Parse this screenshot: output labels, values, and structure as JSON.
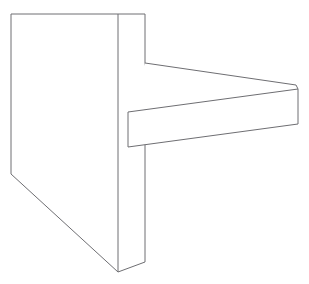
{
  "scene": {
    "title": "3D wireframe line drawing of an L-shaped bracket",
    "object_name": "shelf-bracket",
    "projection": "oblique-parallel",
    "background_color": "#ffffff",
    "line_color": "#6e6e72",
    "fill_color": "#ffffff",
    "line_width": 1,
    "canvas": {
      "width": 309,
      "height": 284
    }
  },
  "geometry": {
    "vertical_slab": {
      "name": "vertical-plate",
      "description": "Trapezoidal upright plate with visible left face and right side thickness",
      "front_face_points": "11,14 118,14 118,272 11,174",
      "side_face_points": "118,14 145,14 145,262 118,272",
      "vertices": {
        "front_top_left": [
          11,
          14
        ],
        "front_top_right": [
          118,
          14
        ],
        "front_bottom_right": [
          118,
          272
        ],
        "front_bottom_left": [
          11,
          174
        ],
        "back_top_right": [
          145,
          14
        ],
        "back_bottom_right": [
          145,
          262
        ]
      }
    },
    "horizontal_beam": {
      "name": "horizontal-arm",
      "description": "Rectangular arm projecting to the right from the plate",
      "top_face_points": "145,63 296,85 298,89 128,112",
      "front_face_points": "128,112 298,89 298,124 128,147",
      "vertices": {
        "top_back_left": [
          145,
          63
        ],
        "top_back_right": [
          296,
          85
        ],
        "top_front_right": [
          298,
          89
        ],
        "top_front_left": [
          128,
          112
        ],
        "bottom_front_right": [
          298,
          124
        ],
        "bottom_front_left": [
          128,
          147
        ]
      }
    }
  },
  "edges": [
    {
      "name": "slab-top-edge",
      "path": "M11,14 L145,14"
    },
    {
      "name": "slab-left-edge",
      "path": "M11,14 L11,174"
    },
    {
      "name": "slab-diagonal-bottom-edge",
      "path": "M11,174 L118,272"
    },
    {
      "name": "slab-front-vertical-edge",
      "path": "M118,14 L118,272"
    },
    {
      "name": "slab-right-vertical-edge",
      "path": "M145,14 L145,262"
    },
    {
      "name": "slab-bottom-side-edge",
      "path": "M118,272 L145,262"
    },
    {
      "name": "beam-top-back-edge",
      "path": "M145,63 L296,85"
    },
    {
      "name": "beam-top-front-edge",
      "path": "M128,112 L298,89"
    },
    {
      "name": "beam-right-top-cap-edge",
      "path": "M296,85 L298,89"
    },
    {
      "name": "beam-right-vertical-edge",
      "path": "M298,89 L298,124"
    },
    {
      "name": "beam-bottom-front-edge",
      "path": "M128,147 L298,124"
    },
    {
      "name": "beam-left-vertical-edge",
      "path": "M128,112 L128,147"
    }
  ]
}
